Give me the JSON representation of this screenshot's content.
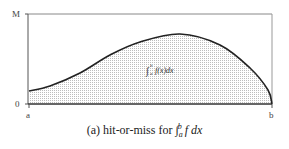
{
  "chart_data": {
    "type": "area",
    "title": "",
    "caption": "(a) hit-or-miss for ∫_a^b f dx",
    "xlabel": "",
    "ylabel": "",
    "x_ticks": [
      "a",
      "b"
    ],
    "y_ticks": [
      "0",
      "M"
    ],
    "grid": false,
    "legend": null,
    "annotation": "∫_a^b f(x)dx",
    "coordinate_space": "pixel (y increases downward); values traced from the screenshot, not numeric data — the axes carry no numeric scale beyond the symbolic labels 0, M, a, b",
    "plot_box_px": {
      "left": 28,
      "top": 14,
      "right": 272,
      "bottom": 104
    },
    "curve_points_px": [
      [
        29,
        91
      ],
      [
        50,
        86
      ],
      [
        80,
        73
      ],
      [
        110,
        55
      ],
      [
        140,
        42
      ],
      [
        180,
        34
      ],
      [
        220,
        45
      ],
      [
        250,
        68
      ],
      [
        268,
        90
      ],
      [
        272,
        104
      ]
    ],
    "fill": "dotted/stippled region under curve"
  },
  "axes": {
    "y_top_label": "M",
    "y_bottom_label": "0",
    "x_left_label": "a",
    "x_right_label": "b"
  },
  "annotation": {
    "integral_symbol": "∫",
    "lower": "a",
    "upper": "b",
    "body": "f(x)dx"
  },
  "caption": {
    "prefix": "(a) hit-or-miss for ",
    "integral_symbol": "∫",
    "lower": "a",
    "upper": "b",
    "body": " f dx"
  },
  "colors": {
    "curve": "#222222",
    "axis": "#333333",
    "box": "#888888",
    "fill_dot": "#bdbdbd"
  }
}
